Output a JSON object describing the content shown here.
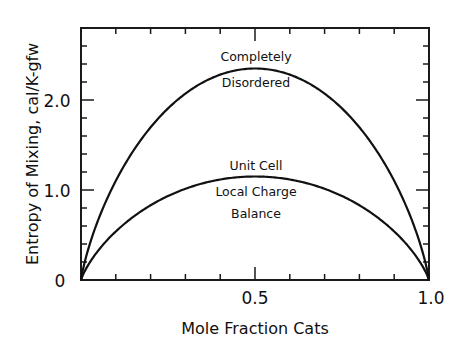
{
  "chart_data": {
    "type": "line",
    "title": "",
    "xlabel": "Mole Fraction Cats",
    "ylabel": "Entropy of Mixing, cal/K-gfw",
    "xlim": [
      0,
      1.0
    ],
    "ylim": [
      0,
      2.8
    ],
    "x_ticks": [
      0,
      0.5,
      1.0
    ],
    "x_tick_labels": [
      "0",
      "0.5",
      "1.0"
    ],
    "x_minor_step": 0.1,
    "y_ticks": [
      0,
      1.0,
      2.0
    ],
    "y_tick_labels": [
      "0",
      "1.0",
      "2.0"
    ],
    "y_minor_step": 0.2,
    "grid": false,
    "legend": null,
    "x": [
      0,
      0.05,
      0.1,
      0.15,
      0.2,
      0.25,
      0.3,
      0.35,
      0.4,
      0.45,
      0.5,
      0.55,
      0.6,
      0.65,
      0.7,
      0.75,
      0.8,
      0.85,
      0.9,
      0.95,
      1.0
    ],
    "series": [
      {
        "name": "Completely Disordered",
        "values": [
          0,
          0.67,
          1.1,
          1.43,
          1.7,
          1.91,
          2.07,
          2.2,
          2.29,
          2.33,
          2.35,
          2.33,
          2.29,
          2.2,
          2.07,
          1.91,
          1.7,
          1.43,
          1.1,
          0.67,
          0
        ]
      },
      {
        "name": "Unit Cell Local Charge Balance",
        "values": [
          0,
          0.33,
          0.54,
          0.7,
          0.83,
          0.93,
          1.01,
          1.08,
          1.12,
          1.14,
          1.15,
          1.14,
          1.12,
          1.08,
          1.01,
          0.93,
          0.83,
          0.7,
          0.54,
          0.33,
          0
        ]
      }
    ],
    "annotations": [
      {
        "text": "Completely",
        "x": 0.5,
        "y": 2.55
      },
      {
        "text": "Disordered",
        "x": 0.5,
        "y": 2.2
      },
      {
        "text": "Unit Cell",
        "x": 0.5,
        "y": 1.3
      },
      {
        "text": "Local Charge",
        "x": 0.5,
        "y": 0.98
      },
      {
        "text": "Balance",
        "x": 0.5,
        "y": 0.68
      }
    ]
  },
  "axis": {
    "x_title": "Mole Fraction Cats",
    "y_title": "Entropy of Mixing, cal/K-gfw",
    "x_labels": [
      "0",
      "0.5",
      "1.0"
    ],
    "y_labels": [
      "0",
      "1.0",
      "2.0"
    ]
  },
  "annotations": {
    "upper_line1": "Completely",
    "upper_line2": "Disordered",
    "lower_line1": "Unit Cell",
    "lower_line2": "Local Charge",
    "lower_line3": "Balance"
  }
}
